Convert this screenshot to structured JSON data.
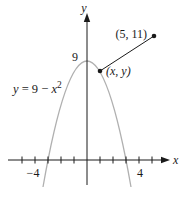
{
  "figure": {
    "colors": {
      "background": "#ffffff",
      "ink": "#1a1a1a",
      "curve": "#b0b0b0"
    },
    "axes": {
      "x_label": "x",
      "y_label": "y",
      "x_tick_neg_label": "−4",
      "x_tick_pos_label": "4",
      "y_value_label": "9"
    },
    "equation": {
      "lhs": "y",
      "mid": " = 9 − ",
      "var": "x",
      "exp": "2",
      "full": "y = 9 − x²"
    },
    "points": [
      {
        "label": "(5, 11)",
        "x": 5,
        "y": 11
      },
      {
        "label": "(x, y)",
        "on_curve": true
      }
    ],
    "segment": {
      "from": "(x, y)",
      "to": "(5, 11)"
    }
  }
}
